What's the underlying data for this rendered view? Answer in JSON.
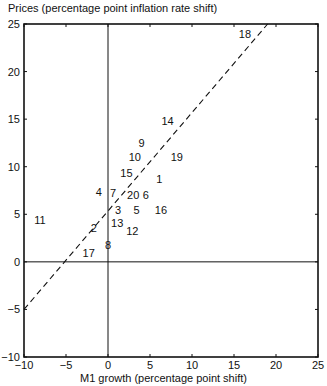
{
  "chart_data": {
    "type": "scatter",
    "title": "",
    "ylabel": "Prices (percentage point inflation rate shift)",
    "xlabel": "M1 growth (percentage point shift)",
    "xlim": [
      -10,
      25
    ],
    "ylim": [
      -10,
      25
    ],
    "xticks": [
      -10,
      -5,
      0,
      5,
      10,
      15,
      20,
      25
    ],
    "yticks": [
      -10,
      -5,
      0,
      5,
      10,
      15,
      20,
      25
    ],
    "grid": false,
    "reference_lines": [
      {
        "type": "vertical",
        "x": 0,
        "style": "solid"
      },
      {
        "type": "horizontal",
        "y": 0,
        "style": "solid"
      },
      {
        "type": "fit",
        "style": "dashed",
        "from": [
          -10,
          -5
        ],
        "to": [
          19,
          25
        ]
      }
    ],
    "marker": "numeric labels",
    "points": [
      {
        "label": "1",
        "x": 6.1,
        "y": 8.7
      },
      {
        "label": "2",
        "x": -1.7,
        "y": 3.6
      },
      {
        "label": "3",
        "x": 1.2,
        "y": 5.5
      },
      {
        "label": "4",
        "x": -1.1,
        "y": 7.3
      },
      {
        "label": "5",
        "x": 3.4,
        "y": 5.5
      },
      {
        "label": "6",
        "x": 4.5,
        "y": 7.0
      },
      {
        "label": "7",
        "x": 0.6,
        "y": 7.2
      },
      {
        "label": "8",
        "x": 0.0,
        "y": 1.8
      },
      {
        "label": "9",
        "x": 4.0,
        "y": 12.5
      },
      {
        "label": "10",
        "x": 3.2,
        "y": 11.0
      },
      {
        "label": "11",
        "x": -8.1,
        "y": 4.4
      },
      {
        "label": "12",
        "x": 2.9,
        "y": 3.2
      },
      {
        "label": "13",
        "x": 1.1,
        "y": 4.1
      },
      {
        "label": "14",
        "x": 7.1,
        "y": 14.8
      },
      {
        "label": "15",
        "x": 2.2,
        "y": 9.3
      },
      {
        "label": "16",
        "x": 6.3,
        "y": 5.4
      },
      {
        "label": "17",
        "x": -2.3,
        "y": 0.9
      },
      {
        "label": "18",
        "x": 16.3,
        "y": 24.0
      },
      {
        "label": "19",
        "x": 8.2,
        "y": 11.0
      },
      {
        "label": "20",
        "x": 3.0,
        "y": 7.0
      }
    ]
  }
}
